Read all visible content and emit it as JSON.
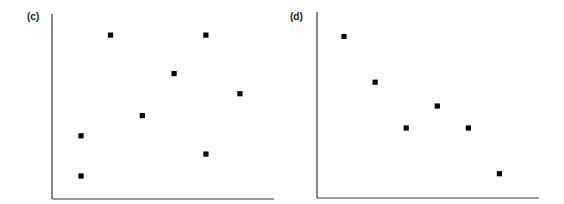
{
  "chart_data": [
    {
      "type": "scatter",
      "title": "(c)",
      "xlabel": "",
      "ylabel": "",
      "grid": false,
      "legend": null,
      "axis_ticks": false,
      "xlim": [
        0,
        10
      ],
      "ylim": [
        0,
        10
      ],
      "marker": "square",
      "marker_color": "#000000",
      "points": [
        {
          "x": 1.3,
          "y": 1.2
        },
        {
          "x": 1.3,
          "y": 3.4
        },
        {
          "x": 2.6,
          "y": 8.9
        },
        {
          "x": 4.0,
          "y": 4.5
        },
        {
          "x": 5.4,
          "y": 6.8
        },
        {
          "x": 6.8,
          "y": 8.9
        },
        {
          "x": 6.8,
          "y": 2.4
        },
        {
          "x": 8.3,
          "y": 5.7
        }
      ]
    },
    {
      "type": "scatter",
      "title": "(d)",
      "xlabel": "",
      "ylabel": "",
      "grid": false,
      "legend": null,
      "axis_ticks": false,
      "xlim": [
        0,
        10
      ],
      "ylim": [
        0,
        10
      ],
      "marker": "square",
      "marker_color": "#000000",
      "points": [
        {
          "x": 1.2,
          "y": 8.8
        },
        {
          "x": 2.6,
          "y": 6.3
        },
        {
          "x": 4.0,
          "y": 3.8
        },
        {
          "x": 5.4,
          "y": 5.0
        },
        {
          "x": 6.8,
          "y": 3.8
        },
        {
          "x": 8.2,
          "y": 1.3
        }
      ]
    }
  ],
  "panels": [
    {
      "label": "(c)"
    },
    {
      "label": "(d)"
    }
  ],
  "colors": {
    "axis": "#3a3a3a",
    "marker": "#000000",
    "background": "#ffffff"
  }
}
